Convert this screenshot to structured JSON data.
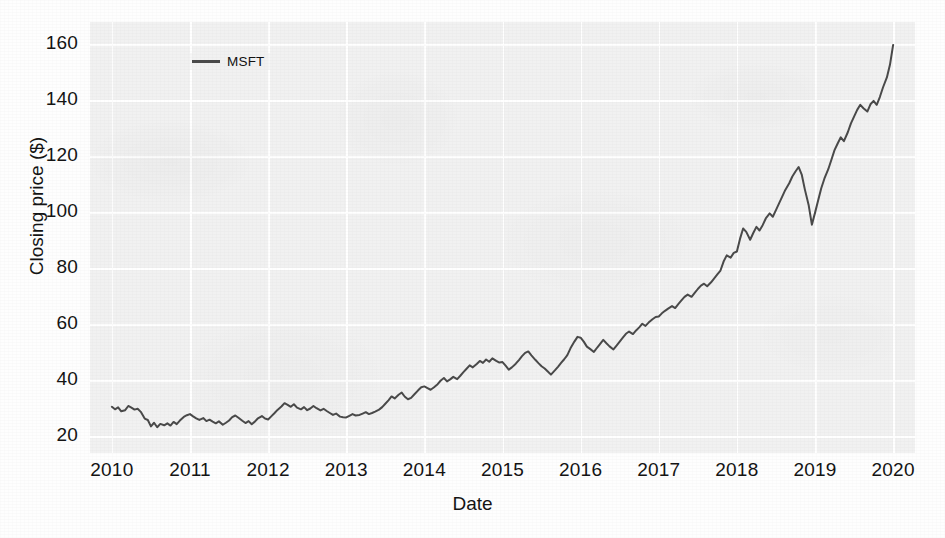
{
  "chart_data": {
    "type": "line",
    "title": "",
    "xlabel": "Date",
    "ylabel": "Closing price ($)",
    "legend": [
      {
        "name": "MSFT",
        "color": "#4a4a4a"
      }
    ],
    "legend_position": "upper left",
    "grid": true,
    "grid_color": "#ffffff",
    "plot_background": "#f1f1f1",
    "xlim": [
      2009.72,
      2020.28
    ],
    "ylim": [
      14.0,
      168.0
    ],
    "xticks": [
      2010,
      2011,
      2012,
      2013,
      2014,
      2015,
      2016,
      2017,
      2018,
      2019,
      2020
    ],
    "xtick_labels": [
      "2010",
      "2011",
      "2012",
      "2013",
      "2014",
      "2015",
      "2016",
      "2017",
      "2018",
      "2019",
      "2020"
    ],
    "yticks": [
      20,
      40,
      60,
      80,
      100,
      120,
      140,
      160
    ],
    "ytick_labels": [
      "20",
      "40",
      "60",
      "80",
      "100",
      "120",
      "140",
      "160"
    ],
    "series": [
      {
        "name": "MSFT",
        "color": "#4a4a4a",
        "linewidth": 2.0,
        "x": [
          2010.0,
          2010.04,
          2010.08,
          2010.12,
          2010.17,
          2010.21,
          2010.25,
          2010.29,
          2010.33,
          2010.37,
          2010.42,
          2010.46,
          2010.5,
          2010.54,
          2010.58,
          2010.62,
          2010.67,
          2010.71,
          2010.75,
          2010.79,
          2010.83,
          2010.87,
          2010.92,
          2010.96,
          2011.0,
          2011.04,
          2011.08,
          2011.12,
          2011.17,
          2011.21,
          2011.25,
          2011.29,
          2011.33,
          2011.37,
          2011.42,
          2011.46,
          2011.5,
          2011.54,
          2011.58,
          2011.62,
          2011.67,
          2011.71,
          2011.75,
          2011.79,
          2011.83,
          2011.87,
          2011.92,
          2011.96,
          2012.0,
          2012.04,
          2012.08,
          2012.12,
          2012.17,
          2012.21,
          2012.25,
          2012.29,
          2012.33,
          2012.37,
          2012.42,
          2012.46,
          2012.5,
          2012.54,
          2012.58,
          2012.62,
          2012.67,
          2012.71,
          2012.75,
          2012.79,
          2012.83,
          2012.87,
          2012.92,
          2012.96,
          2013.0,
          2013.04,
          2013.08,
          2013.12,
          2013.17,
          2013.21,
          2013.25,
          2013.29,
          2013.33,
          2013.37,
          2013.42,
          2013.46,
          2013.5,
          2013.54,
          2013.58,
          2013.62,
          2013.67,
          2013.71,
          2013.75,
          2013.79,
          2013.83,
          2013.87,
          2013.92,
          2013.96,
          2014.0,
          2014.04,
          2014.08,
          2014.12,
          2014.17,
          2014.21,
          2014.25,
          2014.29,
          2014.33,
          2014.37,
          2014.42,
          2014.46,
          2014.5,
          2014.54,
          2014.58,
          2014.62,
          2014.67,
          2014.71,
          2014.75,
          2014.79,
          2014.83,
          2014.87,
          2014.92,
          2014.96,
          2015.0,
          2015.04,
          2015.08,
          2015.12,
          2015.17,
          2015.21,
          2015.25,
          2015.29,
          2015.33,
          2015.37,
          2015.42,
          2015.46,
          2015.5,
          2015.54,
          2015.58,
          2015.62,
          2015.67,
          2015.71,
          2015.75,
          2015.79,
          2015.83,
          2015.87,
          2015.92,
          2015.96,
          2016.0,
          2016.04,
          2016.08,
          2016.12,
          2016.17,
          2016.21,
          2016.25,
          2016.29,
          2016.33,
          2016.37,
          2016.42,
          2016.46,
          2016.5,
          2016.54,
          2016.58,
          2016.62,
          2016.67,
          2016.71,
          2016.75,
          2016.79,
          2016.83,
          2016.87,
          2016.92,
          2016.96,
          2017.0,
          2017.04,
          2017.08,
          2017.12,
          2017.17,
          2017.21,
          2017.25,
          2017.29,
          2017.33,
          2017.37,
          2017.42,
          2017.46,
          2017.5,
          2017.54,
          2017.58,
          2017.62,
          2017.67,
          2017.71,
          2017.75,
          2017.79,
          2017.83,
          2017.87,
          2017.92,
          2017.96,
          2018.0,
          2018.04,
          2018.08,
          2018.12,
          2018.17,
          2018.21,
          2018.25,
          2018.29,
          2018.33,
          2018.37,
          2018.42,
          2018.46,
          2018.5,
          2018.54,
          2018.58,
          2018.62,
          2018.67,
          2018.71,
          2018.75,
          2018.79,
          2018.83,
          2018.87,
          2018.92,
          2018.96,
          2019.0,
          2019.04,
          2019.08,
          2019.12,
          2019.17,
          2019.21,
          2019.25,
          2019.29,
          2019.33,
          2019.37,
          2019.42,
          2019.46,
          2019.5,
          2019.54,
          2019.58,
          2019.62,
          2019.67,
          2019.71,
          2019.75,
          2019.79,
          2019.83,
          2019.87,
          2019.92,
          2019.96,
          2020.0
        ],
        "y": [
          30.5,
          29.6,
          30.3,
          28.9,
          29.3,
          30.8,
          30.2,
          29.5,
          29.8,
          28.7,
          26.3,
          25.8,
          23.5,
          24.8,
          23.2,
          24.4,
          23.9,
          24.6,
          23.8,
          25.1,
          24.3,
          25.6,
          26.9,
          27.5,
          27.9,
          27.1,
          26.4,
          25.8,
          26.5,
          25.4,
          25.9,
          25.2,
          24.6,
          25.3,
          24.1,
          24.8,
          25.6,
          26.8,
          27.4,
          26.6,
          25.5,
          24.7,
          25.4,
          24.3,
          25.2,
          26.4,
          27.2,
          26.3,
          26.0,
          27.1,
          28.2,
          29.4,
          30.6,
          31.8,
          31.2,
          30.5,
          31.4,
          30.2,
          29.6,
          30.4,
          29.3,
          29.9,
          30.8,
          30.0,
          29.2,
          29.8,
          29.0,
          28.3,
          27.6,
          28.1,
          27.0,
          26.8,
          26.7,
          27.3,
          27.9,
          27.4,
          27.6,
          28.1,
          28.6,
          27.9,
          28.3,
          28.8,
          29.5,
          30.4,
          31.6,
          32.8,
          34.2,
          33.5,
          34.8,
          35.6,
          34.1,
          33.2,
          33.7,
          34.9,
          36.4,
          37.5,
          37.8,
          37.2,
          36.6,
          37.4,
          38.6,
          39.9,
          40.8,
          39.6,
          40.3,
          41.2,
          40.4,
          41.6,
          42.9,
          44.1,
          45.3,
          44.6,
          45.8,
          46.9,
          46.2,
          47.4,
          46.6,
          47.8,
          46.9,
          46.3,
          46.5,
          45.2,
          43.8,
          44.6,
          45.9,
          47.2,
          48.6,
          49.8,
          50.3,
          48.9,
          47.3,
          46.1,
          45.0,
          44.2,
          43.1,
          42.0,
          43.5,
          44.8,
          46.2,
          47.5,
          49.0,
          51.4,
          53.8,
          55.5,
          55.2,
          53.8,
          52.0,
          51.2,
          50.1,
          51.6,
          53.0,
          54.4,
          53.2,
          52.1,
          51.0,
          52.4,
          53.8,
          55.2,
          56.6,
          57.4,
          56.5,
          57.8,
          58.9,
          60.2,
          59.4,
          60.6,
          61.8,
          62.6,
          62.8,
          63.9,
          64.8,
          65.6,
          66.5,
          65.8,
          67.2,
          68.5,
          69.8,
          70.6,
          69.8,
          71.2,
          72.6,
          73.8,
          74.5,
          73.6,
          75.0,
          76.4,
          77.8,
          79.2,
          82.4,
          84.6,
          83.8,
          85.5,
          86.0,
          90.5,
          94.2,
          93.0,
          90.2,
          92.6,
          94.8,
          93.5,
          95.4,
          97.8,
          99.6,
          98.4,
          100.8,
          103.2,
          105.6,
          108.0,
          110.4,
          112.8,
          114.6,
          116.2,
          113.5,
          108.2,
          102.4,
          95.6,
          99.8,
          104.2,
          108.6,
          112.0,
          115.4,
          118.8,
          122.2,
          124.6,
          126.8,
          125.4,
          128.6,
          131.8,
          134.2,
          136.6,
          138.4,
          137.2,
          136.0,
          138.6,
          139.8,
          138.4,
          141.2,
          144.6,
          148.2,
          152.8,
          159.8
        ]
      }
    ]
  }
}
